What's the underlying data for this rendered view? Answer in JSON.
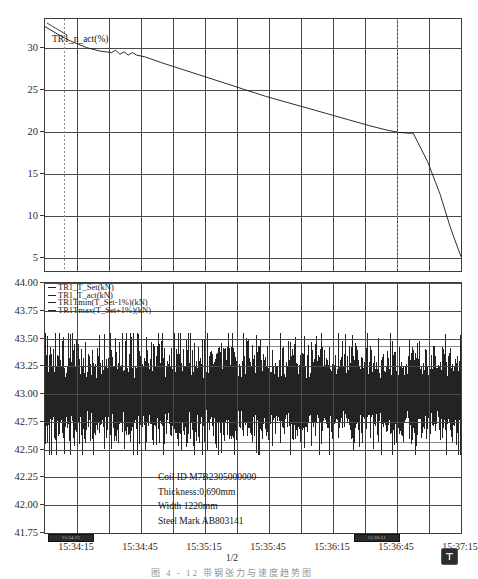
{
  "document": {
    "page_number": "1/2",
    "caption": "图 4 - 12  带钢张力与速度趋势图"
  },
  "top_chart": {
    "legend": [
      {
        "label": "TR1_n_act(%)"
      }
    ],
    "y_ticks": [
      "30",
      "25",
      "20",
      "15",
      "10",
      "5"
    ],
    "ylim": [
      3.5,
      33.5
    ]
  },
  "bottom_chart": {
    "legend": [
      {
        "label": "TR1_T_Set(kN)"
      },
      {
        "label": "TR1_T_act(kN)"
      },
      {
        "label": "TR1Tmin(T_Set-1%)(kN)"
      },
      {
        "label": "TR1Tmax(T_Set+1%)(kN)"
      }
    ],
    "y_ticks": [
      "44.00",
      "43.75",
      "43.50",
      "43.25",
      "43.00",
      "42.75",
      "42.50",
      "42.25",
      "42.00",
      "41.75"
    ],
    "ylim": [
      41.75,
      44.0
    ]
  },
  "coil_info": {
    "coil_id": "Coil ID M7B2305000000",
    "thickness": "Thickness:0,690mm",
    "width": "Width 1220mm",
    "steel_mark": "Steel Mark AB803141"
  },
  "x_axis": {
    "ticks": [
      "15:34:15",
      "15:34:45",
      "15:35:15",
      "15:35:45",
      "15:36:15",
      "15:36:45",
      "15:37:15"
    ]
  },
  "axis_chips": [
    {
      "text": "15:34:13"
    },
    {
      "text": "15:36:51"
    }
  ],
  "chart_data": {
    "type": "line",
    "title": "",
    "xlabel": "",
    "ylabel": "",
    "x_tick_labels": [
      "15:34:15",
      "15:34:45",
      "15:35:15",
      "15:35:45",
      "15:36:15",
      "15:36:45",
      "15:37:15"
    ],
    "panels": [
      {
        "name": "speed",
        "type": "line",
        "ylabel": "TR1_n_act(%)",
        "ylim": [
          3.5,
          33.5
        ],
        "y_ticks": [
          30,
          25,
          20,
          15,
          10,
          5
        ],
        "grid": true,
        "series": [
          {
            "name": "TR1_n_act(%)",
            "x": [
              0,
              0.03,
              0.06,
              0.1,
              0.13,
              0.16,
              0.17,
              0.18,
              0.19,
              0.2,
              0.21,
              0.22,
              0.24,
              0.28,
              0.33,
              0.38,
              0.43,
              0.48,
              0.53,
              0.58,
              0.63,
              0.68,
              0.73,
              0.78,
              0.82,
              0.85,
              0.875,
              0.885,
              0.92,
              0.95,
              0.975,
              1.0
            ],
            "values": [
              32.6,
              31.7,
              30.9,
              30.1,
              29.7,
              29.5,
              29.8,
              29.3,
              29.6,
              29.2,
              29.5,
              29.2,
              29.0,
              28.3,
              27.5,
              26.7,
              25.9,
              25.1,
              24.3,
              23.6,
              22.9,
              22.2,
              21.5,
              20.8,
              20.3,
              20.0,
              19.9,
              19.9,
              16.5,
              12.6,
              8.6,
              5.2
            ]
          }
        ],
        "markers": [
          {
            "type": "vertical-dotted",
            "x": 0.045
          },
          {
            "type": "vertical-dotted",
            "x": 0.845
          }
        ]
      },
      {
        "name": "tension",
        "type": "band",
        "ylabel": "TR1_T_act(kN)",
        "ylim": [
          41.75,
          44.0
        ],
        "y_ticks": [
          44.0,
          43.75,
          43.5,
          43.25,
          43.0,
          42.75,
          42.5,
          42.25,
          42.0,
          41.75
        ],
        "grid": true,
        "series": [
          {
            "name": "TR1_T_Set(kN)",
            "constant": 43.0
          },
          {
            "name": "TR1Tmin(T_Set-1%)(kN)",
            "constant": 42.57
          },
          {
            "name": "TR1Tmax(T_Set+1%)(kN)",
            "constant": 43.43
          },
          {
            "name": "TR1_T_act(kN)",
            "description": "high-frequency noise band oscillating about 43.0 kN",
            "band_min": 42.45,
            "band_max": 43.55,
            "mean": 43.0
          }
        ]
      }
    ]
  }
}
